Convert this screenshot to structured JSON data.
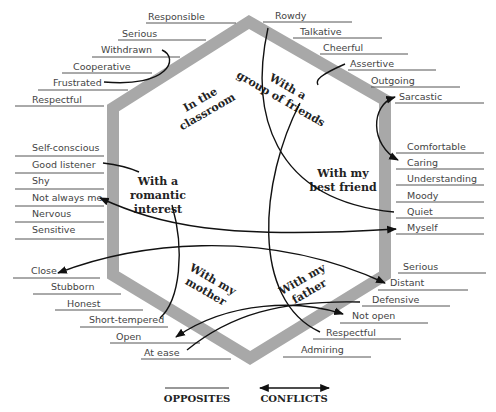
{
  "diagram": {
    "hexagon_color": "#a8a8a8",
    "contexts": [
      {
        "id": "classroom",
        "lines": [
          "In the",
          "classroom"
        ]
      },
      {
        "id": "friends",
        "lines": [
          "With a",
          "group of friends"
        ]
      },
      {
        "id": "best_friend",
        "lines": [
          "With my",
          "best friend"
        ]
      },
      {
        "id": "father",
        "lines": [
          "With my",
          "father"
        ]
      },
      {
        "id": "mother",
        "lines": [
          "With my",
          "mother"
        ]
      },
      {
        "id": "romantic",
        "lines": [
          "With a",
          "romantic",
          "interest"
        ]
      }
    ],
    "traits": {
      "classroom": [
        "Responsible",
        "Serious",
        "Withdrawn",
        "Cooperative",
        "Frustrated",
        "Respectful"
      ],
      "friends": [
        "Rowdy",
        "Talkative",
        "Cheerful",
        "Assertive",
        "Outgoing",
        "Sarcastic"
      ],
      "best_friend": [
        "Comfortable",
        "Caring",
        "Understanding",
        "Moody",
        "Quiet",
        "Myself"
      ],
      "father": [
        "Serious",
        "Distant",
        "Defensive",
        "Not open",
        "Respectful",
        "Admiring"
      ],
      "mother": [
        "Close",
        "Stubborn",
        "Honest",
        "Short-tempered",
        "Open",
        "At ease"
      ],
      "romantic": [
        "Self-conscious",
        "Good listener",
        "Shy",
        "Not always me",
        "Nervous",
        "Sensitive"
      ]
    },
    "opposites": [
      [
        "Withdrawn",
        "Frustrated"
      ],
      [
        "Rowdy",
        "Quiet"
      ],
      [
        "Assertive",
        "Respectful (father)"
      ],
      [
        "Good listener",
        "Short-tempered"
      ],
      [
        "Defensive",
        "At ease"
      ]
    ],
    "conflicts": [
      [
        "Sarcastic",
        "Caring"
      ],
      [
        "Not always me",
        "Myself"
      ],
      [
        "Close",
        "Distant"
      ],
      [
        "Open",
        "Not open"
      ]
    ],
    "legend": {
      "opposites_label": "OPPOSITES",
      "conflicts_label": "CONFLICTS"
    }
  }
}
